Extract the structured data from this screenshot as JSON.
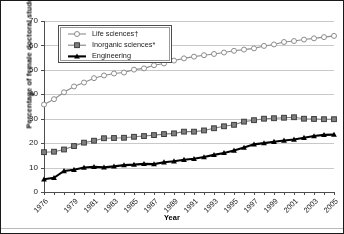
{
  "chart_data": {
    "type": "line",
    "title": "",
    "xlabel": "Year",
    "ylabel": "Percentage of female doctoral students",
    "xlim": [
      1976,
      2005
    ],
    "ylim": [
      0,
      70
    ],
    "ytick_step": 10,
    "yticks": [
      0,
      10,
      20,
      30,
      40,
      50,
      60,
      70
    ],
    "xticks": [
      1976,
      1977,
      1978,
      1979,
      1980,
      1981,
      1982,
      1983,
      1984,
      1985,
      1986,
      1987,
      1988,
      1989,
      1990,
      1991,
      1992,
      1993,
      1994,
      1995,
      1996,
      1997,
      1998,
      1999,
      2000,
      2001,
      2002,
      2003,
      2004,
      2005
    ],
    "xtick_labels": [
      "1976",
      "",
      "",
      "1979",
      "",
      "1981",
      "",
      "1983",
      "",
      "1985",
      "",
      "1987",
      "",
      "1989",
      "",
      "1991",
      "",
      "1993",
      "",
      "1995",
      "",
      "1997",
      "",
      "1999",
      "",
      "2001",
      "",
      "2003",
      "",
      "2005"
    ],
    "grid": true,
    "grid_axis": "y",
    "legend_position": "upper left",
    "x": [
      1976,
      1977,
      1978,
      1979,
      1980,
      1981,
      1982,
      1983,
      1984,
      1985,
      1986,
      1987,
      1988,
      1989,
      1990,
      1991,
      1992,
      1993,
      1994,
      1995,
      1996,
      1997,
      1998,
      1999,
      2000,
      2001,
      2002,
      2003,
      2004,
      2005
    ],
    "series": [
      {
        "name": "Life sciences†",
        "marker": "open-circle",
        "color": "#8c8c8c",
        "values": [
          35.8,
          38.0,
          40.8,
          43.2,
          44.8,
          46.6,
          47.7,
          48.5,
          48.9,
          50.1,
          50.6,
          51.9,
          52.6,
          53.8,
          54.7,
          55.4,
          56.0,
          56.5,
          57.1,
          57.8,
          58.3,
          58.8,
          59.8,
          60.4,
          61.4,
          61.8,
          62.4,
          62.9,
          63.4,
          63.9
        ]
      },
      {
        "name": "Inorganic sciences*",
        "marker": "filled-square",
        "color": "#808080",
        "values": [
          16.3,
          16.5,
          17.4,
          18.8,
          20.2,
          21.0,
          22.0,
          22.1,
          22.2,
          22.6,
          22.9,
          23.3,
          23.7,
          24.0,
          24.7,
          24.7,
          25.2,
          26.1,
          26.9,
          27.5,
          28.8,
          29.4,
          30.0,
          30.2,
          30.4,
          30.6,
          30.0,
          29.9,
          29.8,
          29.8
        ]
      },
      {
        "name": "Engineering",
        "marker": "filled-triangle",
        "color": "#000000",
        "values": [
          5.2,
          5.8,
          8.6,
          9.1,
          10.0,
          10.3,
          10.1,
          10.5,
          11.0,
          11.2,
          11.5,
          11.4,
          12.2,
          12.6,
          13.2,
          13.6,
          14.3,
          15.2,
          16.0,
          17.0,
          18.2,
          19.5,
          20.0,
          20.6,
          21.1,
          21.5,
          22.2,
          22.9,
          23.4,
          23.5
        ]
      }
    ]
  }
}
